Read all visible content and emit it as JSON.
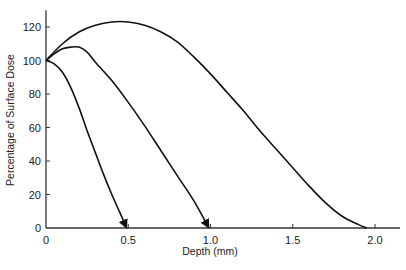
{
  "chart_data": {
    "type": "line",
    "title": "",
    "xlabel": "Depth (mm)",
    "ylabel": "Percentage of Surface Dose",
    "xlim": [
      0,
      2.15
    ],
    "ylim": [
      0,
      130
    ],
    "xticks": [
      0,
      0.5,
      1.0,
      1.5,
      2.0
    ],
    "xtick_labels": [
      "0",
      "0.5",
      "1.0",
      "1.5",
      "2.0"
    ],
    "yticks": [
      0,
      20,
      40,
      60,
      80,
      100,
      120
    ],
    "ytick_labels": [
      "0",
      "20",
      "40",
      "60",
      "80",
      "100",
      "120"
    ],
    "grid": false,
    "legend": null,
    "series": [
      {
        "name": "curve-1 (shallow)",
        "arrow_end": true,
        "x": [
          0,
          0.05,
          0.1,
          0.15,
          0.2,
          0.25,
          0.3,
          0.35,
          0.4,
          0.45,
          0.49
        ],
        "y": [
          100,
          98,
          93,
          84,
          72,
          58,
          45,
          32,
          20,
          9,
          0
        ]
      },
      {
        "name": "curve-2 (intermediate)",
        "arrow_end": true,
        "x": [
          0,
          0.05,
          0.1,
          0.15,
          0.2,
          0.25,
          0.3,
          0.4,
          0.5,
          0.6,
          0.7,
          0.8,
          0.9,
          0.99
        ],
        "y": [
          100,
          104,
          107,
          108,
          108,
          105,
          99,
          88,
          75,
          61,
          46,
          31,
          16,
          0
        ]
      },
      {
        "name": "curve-3 (deep)",
        "arrow_end": false,
        "x": [
          0,
          0.1,
          0.2,
          0.3,
          0.4,
          0.5,
          0.6,
          0.7,
          0.8,
          0.9,
          1.0,
          1.1,
          1.2,
          1.3,
          1.4,
          1.5,
          1.6,
          1.7,
          1.8,
          1.9,
          1.95
        ],
        "y": [
          100,
          110,
          117,
          121,
          123,
          123,
          121,
          117,
          111,
          102,
          92,
          81,
          70,
          58,
          47,
          36,
          25,
          15,
          7,
          2,
          0
        ]
      }
    ]
  }
}
